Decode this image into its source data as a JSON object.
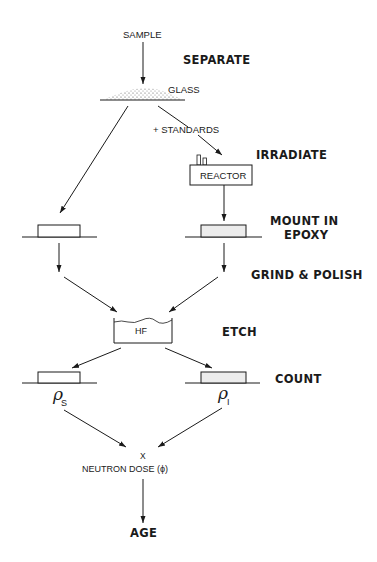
{
  "diagram": {
    "nodes": {
      "sample": "SAMPLE",
      "glass": "GLASS",
      "standards": "+ STANDARDS",
      "reactor": "REACTOR",
      "hf": "HF",
      "rho_s_symbol": "ρ",
      "rho_s_sub": "S",
      "rho_i_symbol": "ρ",
      "rho_i_sub": "I",
      "multiply": "X",
      "neutron_dose": "NEUTRON  DOSE (ϕ)",
      "age": "AGE"
    },
    "steps": [
      {
        "label": "SEPARATE"
      },
      {
        "label": "IRRADIATE"
      },
      {
        "label": "MOUNT  IN",
        "label2": "EPOXY"
      },
      {
        "label": "GRIND  &  POLISH"
      },
      {
        "label": "ETCH"
      },
      {
        "label": "COUNT"
      }
    ],
    "edges": [
      {
        "from": "SAMPLE",
        "to": "GLASS"
      },
      {
        "from": "GLASS",
        "to": "MOUNT (left)"
      },
      {
        "from": "GLASS",
        "to": "REACTOR",
        "label": "+ STANDARDS"
      },
      {
        "from": "REACTOR",
        "to": "MOUNT (right)"
      },
      {
        "from": "MOUNT (left)",
        "to": "HF"
      },
      {
        "from": "MOUNT (right)",
        "to": "HF"
      },
      {
        "from": "HF",
        "to": "COUNT (left, ρS)"
      },
      {
        "from": "HF",
        "to": "COUNT (right, ρI)"
      },
      {
        "from": "ρS",
        "to": "NEUTRON DOSE"
      },
      {
        "from": "ρI",
        "to": "NEUTRON DOSE"
      },
      {
        "from": "NEUTRON DOSE",
        "to": "AGE"
      }
    ]
  }
}
